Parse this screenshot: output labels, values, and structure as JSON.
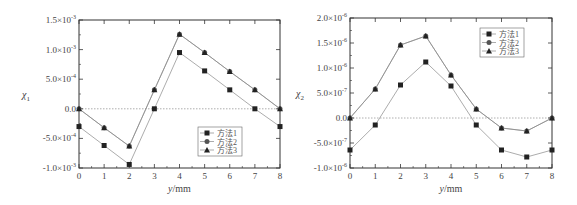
{
  "chart_data": [
    {
      "type": "line",
      "title": "",
      "xlabel": "y/mm",
      "ylabel": "χ1",
      "ylabel_base": "χ",
      "ylabel_sub": "1",
      "x": [
        0,
        1,
        2,
        3,
        4,
        5,
        6,
        7,
        8
      ],
      "xlim": [
        0,
        8
      ],
      "ylim": [
        -0.001,
        0.0015
      ],
      "yticks": [
        -0.001,
        -0.0005,
        0,
        0.0005,
        0.001,
        0.0015
      ],
      "ytick_labels": [
        {
          "m": "-1.0×10",
          "e": "-3"
        },
        {
          "m": "-5.0×10",
          "e": "-4"
        },
        {
          "m": "0.0",
          "e": ""
        },
        {
          "m": "5.0×10",
          "e": "-4"
        },
        {
          "m": "1.0×10",
          "e": "-3"
        },
        {
          "m": "1.5×10",
          "e": "-3"
        }
      ],
      "xtick_labels": [
        "0",
        "1",
        "2",
        "3",
        "4",
        "5",
        "6",
        "7",
        "8"
      ],
      "zero_line": true,
      "legend_position": "lower right",
      "series": [
        {
          "name": "方法1",
          "marker": "square",
          "values": [
            -0.0003,
            -0.00062,
            -0.00094,
            0.0,
            0.00095,
            0.00064,
            0.00032,
            0.0,
            -0.0003
          ]
        },
        {
          "name": "方法2",
          "marker": "circle",
          "values": [
            0.0,
            -0.00032,
            -0.00063,
            0.00032,
            0.00126,
            0.00095,
            0.00063,
            0.00032,
            0.0
          ]
        },
        {
          "name": "方法3",
          "marker": "triangle",
          "values": [
            0.0,
            -0.00032,
            -0.00063,
            0.00032,
            0.00126,
            0.00095,
            0.00063,
            0.00032,
            0.0
          ]
        }
      ]
    },
    {
      "type": "line",
      "title": "",
      "xlabel": "y/mm",
      "ylabel": "χ2",
      "ylabel_base": "χ",
      "ylabel_sub": "2",
      "x": [
        0,
        1,
        2,
        3,
        4,
        5,
        6,
        7,
        8
      ],
      "xlim": [
        0,
        8
      ],
      "ylim": [
        -1e-06,
        2e-06
      ],
      "yticks": [
        -1e-06,
        -5e-07,
        0,
        5e-07,
        1e-06,
        1.5e-06,
        2e-06
      ],
      "ytick_labels": [
        {
          "m": "-1.0×10",
          "e": "-6"
        },
        {
          "m": "-5.0×10",
          "e": "-7"
        },
        {
          "m": "0.0",
          "e": ""
        },
        {
          "m": "5.0×10",
          "e": "-7"
        },
        {
          "m": "1.0×10",
          "e": "-6"
        },
        {
          "m": "1.5×10",
          "e": "-6"
        },
        {
          "m": "2.0×10",
          "e": "-6"
        }
      ],
      "xtick_labels": [
        "0",
        "1",
        "2",
        "3",
        "4",
        "5",
        "6",
        "7",
        "8"
      ],
      "zero_line": true,
      "legend_position": "upper right",
      "series": [
        {
          "name": "方法1",
          "marker": "square",
          "values": [
            -6.4e-07,
            -1.4e-07,
            6.6e-07,
            1.12e-06,
            6.4e-07,
            -1.4e-07,
            -6.4e-07,
            -7.8e-07,
            -6.4e-07
          ]
        },
        {
          "name": "方法2",
          "marker": "circle",
          "values": [
            0.0,
            5.8e-07,
            1.46e-06,
            1.64e-06,
            8.6e-07,
            1.8e-07,
            -2e-07,
            -2.6e-07,
            0.0
          ]
        },
        {
          "name": "方法3",
          "marker": "triangle",
          "values": [
            0.0,
            5.8e-07,
            1.46e-06,
            1.64e-06,
            8.6e-07,
            1.8e-07,
            -2e-07,
            -2.6e-07,
            0.0
          ]
        }
      ]
    }
  ],
  "layout": [
    {
      "left": 79,
      "right": 280,
      "top": 20,
      "bottom": 168,
      "legend": {
        "x": 198,
        "y": 127
      }
    },
    {
      "left": 350,
      "right": 552,
      "top": 18,
      "bottom": 168,
      "legend": {
        "x": 480,
        "y": 28
      }
    }
  ],
  "colors": {
    "axis": "#333333",
    "line": "#888888",
    "marker": "#222222",
    "zero": "#999999"
  }
}
